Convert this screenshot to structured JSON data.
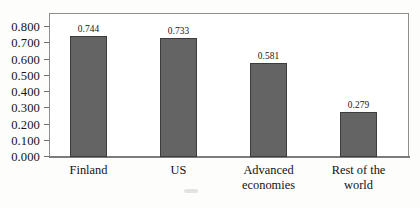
{
  "chart_data": {
    "type": "bar",
    "title": "",
    "subtitle": "",
    "xlabel": "",
    "ylabel": "",
    "categories": [
      "Finland",
      "US",
      "Advanced\neconomies",
      "Rest of the\nworld"
    ],
    "values": [
      0.744,
      0.733,
      0.581,
      0.279
    ],
    "value_labels": [
      "0.744",
      "0.733",
      "0.581",
      "0.279"
    ],
    "ylim": [
      0.0,
      0.8
    ],
    "ytick_labels": [
      "0.800",
      "0.700",
      "0.600",
      "0.500",
      "0.400",
      "0.300",
      "0.200",
      "0.100",
      "0.000"
    ],
    "ytick_values": [
      0.8,
      0.7,
      0.6,
      0.5,
      0.4,
      0.3,
      0.2,
      0.1,
      0.0
    ],
    "grid": false,
    "legend": null,
    "legend_position": "none",
    "series": [
      {
        "name": "",
        "values": [
          0.744,
          0.733,
          0.581,
          0.279
        ]
      }
    ],
    "colors": {
      "bar_fill": "#646464",
      "bar_border": "#3c3c3c",
      "frame": "#8d8d8d",
      "axis": "#7c7c7c",
      "text": "#141414",
      "background": "#ffffff"
    }
  }
}
